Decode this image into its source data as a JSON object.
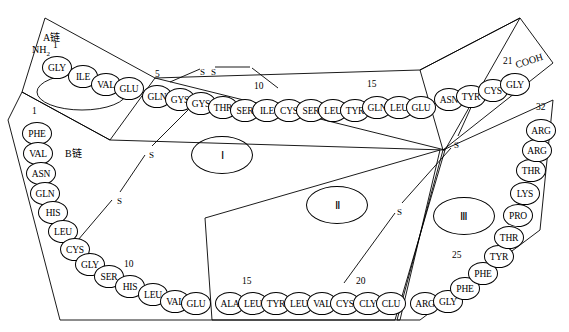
{
  "diagram": {
    "title_labels": {
      "chain_a": "A链",
      "chain_b": "B链",
      "n_terminus": "NH2",
      "c_terminus": "COOH"
    },
    "regions": [
      {
        "name": "region-one",
        "label": "Ⅰ",
        "x": 191,
        "y": 136,
        "w": 62,
        "h": 38
      },
      {
        "name": "region-two",
        "label": "Ⅱ",
        "x": 306,
        "y": 186,
        "w": 62,
        "h": 38
      },
      {
        "name": "region-three",
        "label": "Ⅲ",
        "x": 433,
        "y": 197,
        "w": 62,
        "h": 38
      }
    ],
    "bond_labels": [
      {
        "name": "disulfide-s-top-left",
        "text": "S",
        "x": 200,
        "y": 67
      },
      {
        "name": "disulfide-s-top-right",
        "text": "S",
        "x": 211,
        "y": 67
      },
      {
        "name": "disulfide-s-left-upper",
        "text": "S",
        "x": 149,
        "y": 150
      },
      {
        "name": "disulfide-s-left-lower",
        "text": "S",
        "x": 117,
        "y": 196
      },
      {
        "name": "disulfide-s-right-upper",
        "text": "S",
        "x": 454,
        "y": 140
      },
      {
        "name": "disulfide-s-right-lower",
        "text": "S",
        "x": 397,
        "y": 207
      }
    ],
    "chain_a": {
      "name": "chain-a",
      "label": "A链",
      "residues": [
        {
          "name": "residue-a1",
          "text": "GLY",
          "x": 42,
          "y": 56
        },
        {
          "name": "residue-a2",
          "text": "ILE",
          "x": 68,
          "y": 65
        },
        {
          "name": "residue-a3",
          "text": "VAL",
          "x": 91,
          "y": 73
        },
        {
          "name": "residue-a4",
          "text": "GLU",
          "x": 114,
          "y": 77
        },
        {
          "name": "residue-a5",
          "text": "GLN",
          "x": 142,
          "y": 85
        },
        {
          "name": "residue-a6",
          "text": "GYS",
          "x": 165,
          "y": 88
        },
        {
          "name": "residue-a7",
          "text": "GYS",
          "x": 186,
          "y": 92
        },
        {
          "name": "residue-a8",
          "text": "THR",
          "x": 208,
          "y": 96
        },
        {
          "name": "residue-a9",
          "text": "SER",
          "x": 230,
          "y": 99
        },
        {
          "name": "residue-a10",
          "text": "ILE",
          "x": 252,
          "y": 99
        },
        {
          "name": "residue-a11",
          "text": "CYS",
          "x": 274,
          "y": 99
        },
        {
          "name": "residue-a12",
          "text": "SER",
          "x": 296,
          "y": 99
        },
        {
          "name": "residue-a13",
          "text": "LEU",
          "x": 318,
          "y": 99
        },
        {
          "name": "residue-a14",
          "text": "TYR",
          "x": 340,
          "y": 99
        },
        {
          "name": "residue-a15",
          "text": "GLN",
          "x": 362,
          "y": 96
        },
        {
          "name": "residue-a16",
          "text": "LEU",
          "x": 384,
          "y": 96
        },
        {
          "name": "residue-a17",
          "text": "GLU",
          "x": 406,
          "y": 96
        },
        {
          "name": "residue-a18",
          "text": "ASN",
          "x": 434,
          "y": 88
        },
        {
          "name": "residue-a19",
          "text": "TYR",
          "x": 456,
          "y": 85
        },
        {
          "name": "residue-a20",
          "text": "CYS",
          "x": 478,
          "y": 79
        },
        {
          "name": "residue-a21",
          "text": "GLY",
          "x": 500,
          "y": 73
        }
      ],
      "numbers": [
        {
          "name": "number-a-1",
          "text": "1",
          "x": 53,
          "y": 40
        },
        {
          "name": "number-a-5",
          "text": "5",
          "x": 155,
          "y": 69
        },
        {
          "name": "number-a-10",
          "text": "10",
          "x": 254,
          "y": 81
        },
        {
          "name": "number-a-15",
          "text": "15",
          "x": 367,
          "y": 79
        },
        {
          "name": "number-a-21",
          "text": "21",
          "x": 503,
          "y": 56
        }
      ]
    },
    "chain_b": {
      "name": "chain-b",
      "label": "B链",
      "residues": [
        {
          "name": "residue-b1",
          "text": "PHE",
          "x": 22,
          "y": 122
        },
        {
          "name": "residue-b2",
          "text": "VAL",
          "x": 23,
          "y": 142
        },
        {
          "name": "residue-b3",
          "text": "ASN",
          "x": 26,
          "y": 162
        },
        {
          "name": "residue-b4",
          "text": "GLN",
          "x": 30,
          "y": 182
        },
        {
          "name": "residue-b5",
          "text": "HIS",
          "x": 38,
          "y": 201
        },
        {
          "name": "residue-b6",
          "text": "LEU",
          "x": 48,
          "y": 220
        },
        {
          "name": "residue-b7",
          "text": "CYS",
          "x": 60,
          "y": 238
        },
        {
          "name": "residue-b8",
          "text": "GLY",
          "x": 75,
          "y": 253
        },
        {
          "name": "residue-b9",
          "text": "SER",
          "x": 94,
          "y": 265
        },
        {
          "name": "residue-b10",
          "text": "HIS",
          "x": 115,
          "y": 275
        },
        {
          "name": "residue-b11",
          "text": "LEU",
          "x": 138,
          "y": 283
        },
        {
          "name": "residue-b12",
          "text": "VAL",
          "x": 160,
          "y": 290
        },
        {
          "name": "residue-b13",
          "text": "GLU",
          "x": 181,
          "y": 292
        },
        {
          "name": "residue-b14",
          "text": "ALA",
          "x": 215,
          "y": 292
        },
        {
          "name": "residue-b15",
          "text": "LEU",
          "x": 238,
          "y": 292
        },
        {
          "name": "residue-b16",
          "text": "TYR",
          "x": 261,
          "y": 292
        },
        {
          "name": "residue-b17",
          "text": "LEU",
          "x": 284,
          "y": 292
        },
        {
          "name": "residue-b18",
          "text": "VAL",
          "x": 307,
          "y": 292
        },
        {
          "name": "residue-b19",
          "text": "CYS",
          "x": 330,
          "y": 292
        },
        {
          "name": "residue-b20",
          "text": "CLY",
          "x": 353,
          "y": 292
        },
        {
          "name": "residue-b21",
          "text": "CLU",
          "x": 376,
          "y": 292
        },
        {
          "name": "residue-b22",
          "text": "ARG",
          "x": 410,
          "y": 292
        },
        {
          "name": "residue-b23",
          "text": "GLY",
          "x": 433,
          "y": 290
        },
        {
          "name": "residue-b24",
          "text": "PHE",
          "x": 450,
          "y": 277
        },
        {
          "name": "residue-b25",
          "text": "PHE",
          "x": 468,
          "y": 262
        },
        {
          "name": "residue-b26",
          "text": "TYR",
          "x": 484,
          "y": 245
        },
        {
          "name": "residue-b27",
          "text": "THR",
          "x": 494,
          "y": 226
        },
        {
          "name": "residue-b28",
          "text": "PRO",
          "x": 503,
          "y": 204
        },
        {
          "name": "residue-b29",
          "text": "LYS",
          "x": 510,
          "y": 182
        },
        {
          "name": "residue-b30",
          "text": "THR",
          "x": 516,
          "y": 159
        },
        {
          "name": "residue-b31",
          "text": "ARG",
          "x": 522,
          "y": 139
        },
        {
          "name": "residue-b32",
          "text": "ARG",
          "x": 526,
          "y": 119
        }
      ],
      "numbers": [
        {
          "name": "number-b-1",
          "text": "1",
          "x": 32,
          "y": 106
        },
        {
          "name": "number-b-10",
          "text": "10",
          "x": 124,
          "y": 259
        },
        {
          "name": "number-b-15",
          "text": "15",
          "x": 242,
          "y": 276
        },
        {
          "name": "number-b-20",
          "text": "20",
          "x": 356,
          "y": 276
        },
        {
          "name": "number-b-25",
          "text": "25",
          "x": 452,
          "y": 250
        },
        {
          "name": "number-b-32",
          "text": "32",
          "x": 536,
          "y": 102
        }
      ]
    }
  }
}
